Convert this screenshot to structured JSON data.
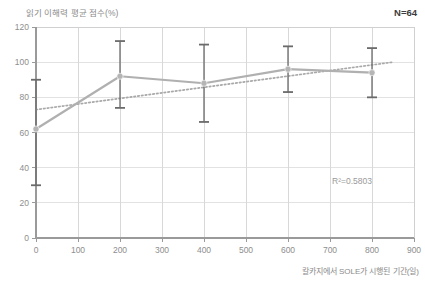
{
  "chart_data": {
    "type": "line",
    "title": "읽기 이해력 평균 점수(%)",
    "xlabel": "칼카지에서 SOLE가 시행된 기간(일)",
    "ylabel": "",
    "xlim": [
      0,
      900
    ],
    "ylim": [
      0,
      120
    ],
    "xticks": [
      0,
      100,
      200,
      300,
      400,
      500,
      600,
      700,
      800,
      900
    ],
    "yticks": [
      0,
      20,
      40,
      60,
      80,
      100,
      120
    ],
    "grid": true,
    "legend": "none",
    "annotations": {
      "sample_size": "N=64",
      "r_squared": "R²=0.5803"
    },
    "series": [
      {
        "name": "읽기 이해력 평균 점수",
        "style": "line-with-error-bars",
        "color": "#b0b0b0",
        "marker_color": "#b5b5b5",
        "errorbar_color": "#6b6b6b",
        "x": [
          0,
          200,
          400,
          600,
          800
        ],
        "values": [
          62,
          92,
          88,
          96,
          94
        ],
        "error_low": [
          30,
          74,
          66,
          83,
          80
        ],
        "error_high": [
          90,
          112,
          110,
          109,
          108
        ]
      },
      {
        "name": "추세선",
        "style": "dotted-trendline",
        "color": "#a8a8a8",
        "x": [
          0,
          850
        ],
        "values": [
          73,
          100
        ]
      }
    ]
  },
  "axis": {
    "x_tick_labels": [
      "0",
      "100",
      "200",
      "300",
      "400",
      "500",
      "600",
      "700",
      "800",
      "900"
    ],
    "y_tick_labels": [
      "0",
      "20",
      "40",
      "60",
      "80",
      "100",
      "120"
    ]
  }
}
